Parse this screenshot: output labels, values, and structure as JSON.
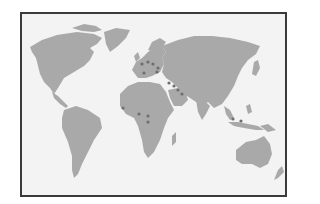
{
  "map": {
    "type": "world-map",
    "colors": {
      "background": "#f3f3f3",
      "land": "#a9a9a9",
      "marker": "#6e6e6e",
      "frame": "#3a3a3a"
    },
    "markers": [
      {
        "region": "western-europe",
        "x": 140,
        "y": 62
      },
      {
        "region": "central-europe",
        "x": 146,
        "y": 60
      },
      {
        "region": "central-europe-2",
        "x": 151,
        "y": 62
      },
      {
        "region": "southern-europe",
        "x": 142,
        "y": 71
      },
      {
        "region": "balkans",
        "x": 155,
        "y": 70
      },
      {
        "region": "eastern-europe",
        "x": 156,
        "y": 66
      },
      {
        "region": "turkey",
        "x": 167,
        "y": 81
      },
      {
        "region": "middle-east",
        "x": 172,
        "y": 84
      },
      {
        "region": "iran",
        "x": 176,
        "y": 88
      },
      {
        "region": "gulf",
        "x": 180,
        "y": 92
      },
      {
        "region": "west-africa",
        "x": 121,
        "y": 106
      },
      {
        "region": "nigeria",
        "x": 137,
        "y": 112
      },
      {
        "region": "central-africa",
        "x": 146,
        "y": 114
      },
      {
        "region": "congo",
        "x": 146,
        "y": 120
      },
      {
        "region": "southeast-asia",
        "x": 231,
        "y": 117
      },
      {
        "region": "indonesia",
        "x": 239,
        "y": 119
      }
    ]
  }
}
